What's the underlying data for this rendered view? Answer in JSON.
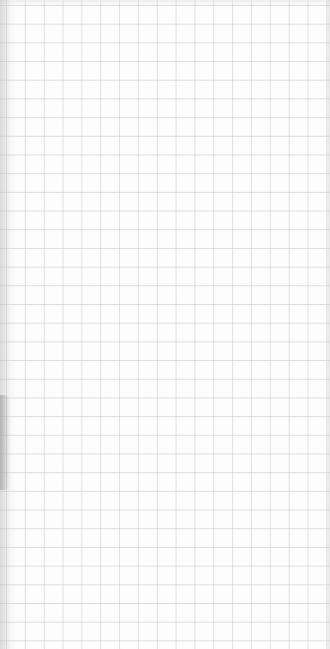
{
  "image": {
    "subject": "grid paper sheet",
    "grid": {
      "cell_size_px": 18.8,
      "line_color": "#c8c8c8",
      "paper_color": "#fdfdfd"
    },
    "text": []
  }
}
